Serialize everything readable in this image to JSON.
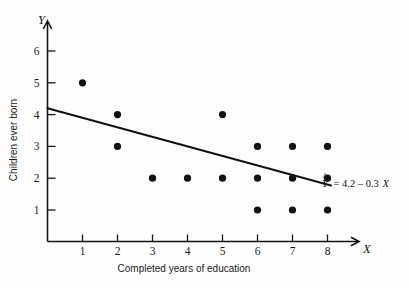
{
  "chart_data": {
    "type": "scatter",
    "title": "",
    "xlabel": "Completed years of education",
    "ylabel": "Children ever born",
    "x_axis_letter": "X",
    "y_axis_letter": "Y",
    "xlim": [
      0,
      8.8
    ],
    "ylim": [
      0,
      6.6
    ],
    "xticks": [
      1,
      2,
      3,
      4,
      5,
      6,
      7,
      8
    ],
    "yticks": [
      1,
      2,
      3,
      4,
      5,
      6
    ],
    "xtick_labels": [
      "1",
      "2",
      "3",
      "4",
      "5",
      "6",
      "7",
      "8"
    ],
    "ytick_labels": [
      "1",
      "2",
      "3",
      "4",
      "5",
      "6"
    ],
    "grid": false,
    "legend": "none",
    "points": [
      {
        "x": 1,
        "y": 5
      },
      {
        "x": 2,
        "y": 4
      },
      {
        "x": 2,
        "y": 3
      },
      {
        "x": 3,
        "y": 2
      },
      {
        "x": 4,
        "y": 2
      },
      {
        "x": 5,
        "y": 4
      },
      {
        "x": 5,
        "y": 2
      },
      {
        "x": 6,
        "y": 3
      },
      {
        "x": 6,
        "y": 2
      },
      {
        "x": 6,
        "y": 1
      },
      {
        "x": 7,
        "y": 3
      },
      {
        "x": 7,
        "y": 2
      },
      {
        "x": 7,
        "y": 1
      },
      {
        "x": 8,
        "y": 3
      },
      {
        "x": 8,
        "y": 2
      },
      {
        "x": 8,
        "y": 1
      }
    ],
    "fit_line": {
      "intercept": 4.2,
      "slope": -0.3,
      "x_start": 0,
      "x_end": 8.1,
      "label_parts": {
        "y_hat": "Y",
        "hat_symbol": "^",
        "equals": "= 4.2 – 0.3",
        "x_var": "X"
      },
      "label_full": "Ŷ = 4.2 – 0.3X"
    },
    "marker": {
      "shape": "filled-circle",
      "radius_px": 3.6,
      "color": "#111111"
    },
    "colors": {
      "ink": "#111111",
      "background": "#fefefe",
      "line": "#111111"
    }
  }
}
